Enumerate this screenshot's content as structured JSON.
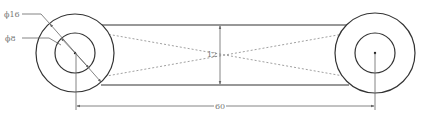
{
  "drawing": {
    "labels": {
      "outer_diameter": "ϕ16",
      "inner_diameter": "ϕ8",
      "height": "12",
      "length": "60"
    },
    "colors": {
      "line": "#333333",
      "dim": "#666666",
      "hidden": "#888888",
      "text": "#777777"
    }
  }
}
